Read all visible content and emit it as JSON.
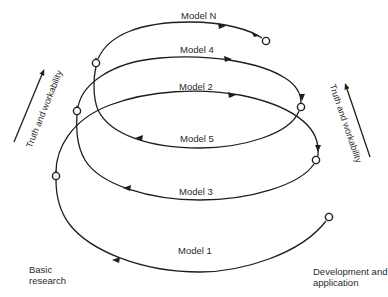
{
  "diagram": {
    "type": "spiral-model",
    "models": [
      {
        "id": "model-1",
        "label": "Model 1",
        "direction": "leftward"
      },
      {
        "id": "model-2",
        "label": "Model 2",
        "direction": "rightward"
      },
      {
        "id": "model-3",
        "label": "Model 3",
        "direction": "leftward"
      },
      {
        "id": "model-4",
        "label": "Model 4",
        "direction": "rightward"
      },
      {
        "id": "model-5",
        "label": "Model 5",
        "direction": "leftward"
      },
      {
        "id": "model-n",
        "label": "Model N",
        "direction": "rightward"
      }
    ],
    "axes": {
      "left": "Truth and workability",
      "right": "Truth and workability"
    },
    "corners": {
      "bottom_left": [
        "Basic",
        "research"
      ],
      "bottom_right": [
        "Development and",
        "application"
      ]
    },
    "stroke_color": "#1e1e1e"
  }
}
